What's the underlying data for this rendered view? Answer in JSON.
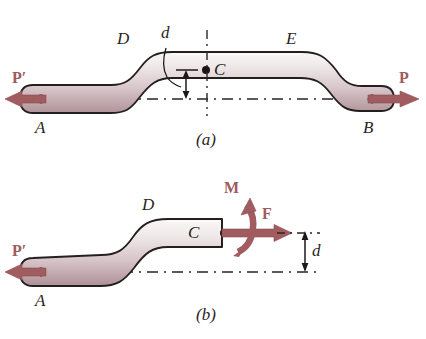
{
  "figure": {
    "background_color": "#ffffff",
    "force_color": "#a05c5f",
    "body_fill_light": "#f2eeee",
    "body_fill_dark": "#b79ba0",
    "outline_color": "#241f1e",
    "dash_color": "#2b2524"
  },
  "panels": [
    {
      "id": "a",
      "caption": "(a)",
      "labels": {
        "point_a": "A",
        "point_b": "B",
        "point_c": "C",
        "point_d": "D",
        "point_e": "E",
        "dimension_d": "d",
        "force_left": "P′",
        "force_right": "P"
      }
    },
    {
      "id": "b",
      "caption": "(b)",
      "labels": {
        "point_a": "A",
        "point_c": "C",
        "point_d": "D",
        "dimension_d": "d",
        "force_left": "P′",
        "force_right": "F",
        "moment": "M"
      }
    }
  ]
}
